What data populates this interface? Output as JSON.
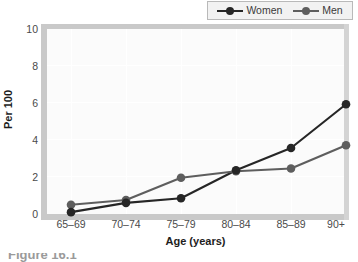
{
  "chart_data": {
    "type": "line",
    "title": "",
    "xlabel": "Age (years)",
    "ylabel": "Per 100",
    "categories": [
      "65–69",
      "70–74",
      "75–79",
      "80–84",
      "85–89",
      "90+"
    ],
    "ylim": [
      0,
      10
    ],
    "yticks": [
      0,
      2,
      4,
      6,
      8,
      10
    ],
    "grid": true,
    "legend_position": "top-right",
    "series": [
      {
        "name": "Women",
        "color": "#262626",
        "values": [
          0.1,
          0.6,
          0.85,
          2.35,
          3.55,
          5.9
        ]
      },
      {
        "name": "Men",
        "color": "#5e5e5e",
        "values": [
          0.5,
          0.75,
          1.95,
          2.3,
          2.45,
          3.7
        ]
      }
    ]
  },
  "legend": {
    "entries": [
      {
        "label": "Women",
        "color": "#262626"
      },
      {
        "label": "Men",
        "color": "#5e5e5e"
      }
    ]
  },
  "axes": {
    "y_title": "Per 100",
    "x_title": "Age (years)",
    "y_tick_labels": [
      "10",
      "8",
      "6",
      "4",
      "2",
      "0"
    ],
    "x_tick_labels": [
      "65–69",
      "70–74",
      "75–79",
      "80–84",
      "85–89",
      "90+"
    ]
  },
  "caption": {
    "text": "Figure 16.1"
  },
  "colors": {
    "plot_background": "#fbfbfb",
    "spine": "#c9c9c9",
    "gridline": "#ffffff",
    "legend_background": "#f2f2f2",
    "legend_border": "#b9b9b9",
    "tick_text": "#4a4a4a",
    "axis_title_text": "#1d1d1d"
  }
}
